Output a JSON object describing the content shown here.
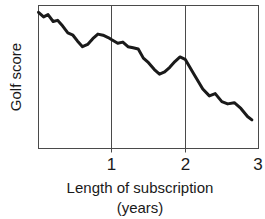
{
  "chart_data": {
    "type": "line",
    "title": "",
    "subtitle": "",
    "xlabel": "Length of subscription",
    "xlabel_line2": "(years)",
    "ylabel": "Golf score",
    "xlim": [
      0,
      3
    ],
    "ylim": [
      0,
      100
    ],
    "xticks": [
      1,
      2,
      3
    ],
    "xtick_labels": [
      "1",
      "2",
      "3"
    ],
    "yticks": [],
    "ytick_labels": [],
    "grid": "vertical gridlines at x = 1 and x = 2",
    "legend": "none",
    "series": [
      {
        "name": "Golf score vs length of subscription",
        "x": [
          0.0,
          0.07,
          0.13,
          0.2,
          0.26,
          0.33,
          0.4,
          0.47,
          0.53,
          0.6,
          0.67,
          0.74,
          0.81,
          0.88,
          0.95,
          1.0,
          1.08,
          1.15,
          1.22,
          1.29,
          1.36,
          1.43,
          1.5,
          1.58,
          1.65,
          1.72,
          1.79,
          1.86,
          1.93,
          2.0,
          2.12,
          2.24,
          2.33,
          2.41,
          2.5,
          2.58,
          2.67,
          2.76,
          2.85,
          2.91
        ],
        "y": [
          95.2,
          92.0,
          93.6,
          88.8,
          89.6,
          85.6,
          80.8,
          79.2,
          75.2,
          71.2,
          72.8,
          76.8,
          80.0,
          79.2,
          77.6,
          76.0,
          73.6,
          74.4,
          71.2,
          70.4,
          69.6,
          63.2,
          60.0,
          55.2,
          52.0,
          53.6,
          56.8,
          60.8,
          64.0,
          62.4,
          52.0,
          41.6,
          36.8,
          38.4,
          32.8,
          31.2,
          32.0,
          28.0,
          22.4,
          20.0
        ],
        "color": "#1a1a1a",
        "linewidth": 3
      }
    ]
  }
}
